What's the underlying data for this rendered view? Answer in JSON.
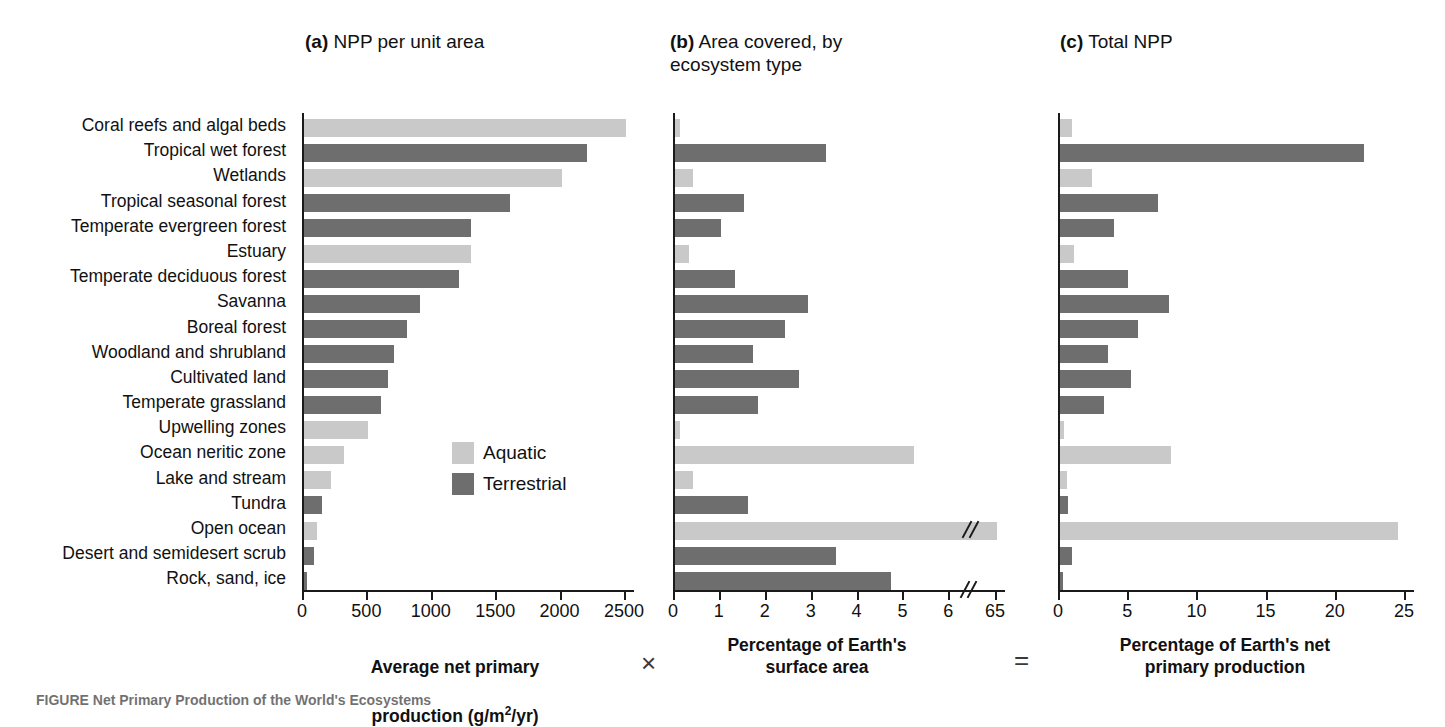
{
  "panels": {
    "a": {
      "prefix": "(a)",
      "title": "NPP per unit area"
    },
    "b": {
      "prefix": "(b)",
      "title": "Area covered, by\necosystem type"
    },
    "c": {
      "prefix": "(c)",
      "title": "Total NPP"
    }
  },
  "legend": {
    "position": "inside-panel-a",
    "items": [
      {
        "label": "Aquatic",
        "color": "#c9c9c9"
      },
      {
        "label": "Terrestrial",
        "color": "#6e6e6e"
      }
    ]
  },
  "captions": {
    "a_line1": "Average net primary",
    "a_line2_pre": "production (g/m",
    "a_line2_sup": "2",
    "a_line2_post": "/yr)",
    "b": "Percentage of Earth's\nsurface area",
    "c": "Percentage of Earth's net\nprimary production",
    "operator_times": "×",
    "operator_equals": "=",
    "figure_caption": "FIGURE  Net Primary Production of the World's Ecosystems"
  },
  "colors": {
    "aquatic": "#c9c9c9",
    "terrestrial": "#6e6e6e",
    "axis": "#1a1a1a",
    "text": "#111111",
    "background": "#ffffff"
  },
  "chart_data": [
    {
      "id": "a",
      "type": "bar",
      "orientation": "horizontal",
      "title": "(a) NPP per unit area",
      "xlabel": "Average net primary production (g/m2/yr)",
      "ylabel": "",
      "xlim": [
        0,
        2500
      ],
      "xticks": [
        0,
        500,
        1000,
        1500,
        2000,
        2500
      ],
      "xticklabels": [
        "0",
        "500",
        "1000",
        "1500",
        "2000",
        "2500"
      ],
      "grid": false,
      "axis_break": false,
      "categories": [
        "Coral reefs and algal beds",
        "Tropical wet forest",
        "Wetlands",
        "Tropical seasonal forest",
        "Temperate evergreen forest",
        "Estuary",
        "Temperate deciduous forest",
        "Savanna",
        "Boreal forest",
        "Woodland and shrubland",
        "Cultivated land",
        "Temperate grassland",
        "Upwelling zones",
        "Ocean neritic zone",
        "Lake and stream",
        "Tundra",
        "Open ocean",
        "Desert and semidesert scrub",
        "Rock, sand, ice"
      ],
      "groups": [
        "Aquatic",
        "Terrestrial",
        "Aquatic",
        "Terrestrial",
        "Terrestrial",
        "Aquatic",
        "Terrestrial",
        "Terrestrial",
        "Terrestrial",
        "Terrestrial",
        "Terrestrial",
        "Terrestrial",
        "Aquatic",
        "Aquatic",
        "Aquatic",
        "Terrestrial",
        "Aquatic",
        "Terrestrial",
        "Terrestrial"
      ],
      "values": [
        2500,
        2200,
        2000,
        1600,
        1300,
        1300,
        1200,
        900,
        800,
        700,
        650,
        600,
        500,
        310,
        210,
        140,
        100,
        80,
        20
      ]
    },
    {
      "id": "b",
      "type": "bar",
      "orientation": "horizontal",
      "title": "(b) Area covered, by ecosystem type",
      "xlabel": "Percentage of Earth's surface area",
      "ylabel": "",
      "xlim": [
        0,
        65
      ],
      "xticks": [
        0,
        1,
        2,
        3,
        4,
        5,
        6,
        65
      ],
      "xticklabels": [
        "0",
        "1",
        "2",
        "3",
        "4",
        "5",
        "6",
        "65"
      ],
      "grid": false,
      "axis_break": true,
      "axis_break_note": "scale break between 6 and 65",
      "categories": [
        "Coral reefs and algal beds",
        "Tropical wet forest",
        "Wetlands",
        "Tropical seasonal forest",
        "Temperate evergreen forest",
        "Estuary",
        "Temperate deciduous forest",
        "Savanna",
        "Boreal forest",
        "Woodland and shrubland",
        "Cultivated land",
        "Temperate grassland",
        "Upwelling zones",
        "Ocean neritic zone",
        "Lake and stream",
        "Tundra",
        "Open ocean",
        "Desert and semidesert scrub",
        "Rock, sand, ice"
      ],
      "groups": [
        "Aquatic",
        "Terrestrial",
        "Aquatic",
        "Terrestrial",
        "Terrestrial",
        "Aquatic",
        "Terrestrial",
        "Terrestrial",
        "Terrestrial",
        "Terrestrial",
        "Terrestrial",
        "Terrestrial",
        "Aquatic",
        "Aquatic",
        "Aquatic",
        "Terrestrial",
        "Aquatic",
        "Terrestrial",
        "Terrestrial"
      ],
      "values": [
        0.1,
        3.3,
        0.4,
        1.5,
        1.0,
        0.3,
        1.3,
        2.9,
        2.4,
        1.7,
        2.7,
        1.8,
        0.1,
        5.2,
        0.4,
        1.6,
        65,
        3.5,
        4.7
      ]
    },
    {
      "id": "c",
      "type": "bar",
      "orientation": "horizontal",
      "title": "(c) Total NPP",
      "xlabel": "Percentage of Earth's net primary production",
      "ylabel": "",
      "xlim": [
        0,
        25
      ],
      "xticks": [
        0,
        5,
        10,
        15,
        20,
        25
      ],
      "xticklabels": [
        "0",
        "5",
        "10",
        "15",
        "20",
        "25"
      ],
      "grid": false,
      "axis_break": false,
      "categories": [
        "Coral reefs and algal beds",
        "Tropical wet forest",
        "Wetlands",
        "Tropical seasonal forest",
        "Temperate evergreen forest",
        "Estuary",
        "Temperate deciduous forest",
        "Savanna",
        "Boreal forest",
        "Woodland and shrubland",
        "Cultivated land",
        "Temperate grassland",
        "Upwelling zones",
        "Ocean neritic zone",
        "Lake and stream",
        "Tundra",
        "Open ocean",
        "Desert and semidesert scrub",
        "Rock, sand, ice"
      ],
      "groups": [
        "Aquatic",
        "Terrestrial",
        "Aquatic",
        "Terrestrial",
        "Terrestrial",
        "Aquatic",
        "Terrestrial",
        "Terrestrial",
        "Terrestrial",
        "Terrestrial",
        "Terrestrial",
        "Terrestrial",
        "Aquatic",
        "Aquatic",
        "Aquatic",
        "Terrestrial",
        "Aquatic",
        "Terrestrial",
        "Terrestrial"
      ],
      "values": [
        0.9,
        22.0,
        2.3,
        7.1,
        3.9,
        1.0,
        4.9,
        7.9,
        5.6,
        3.5,
        5.1,
        3.2,
        0.3,
        8.0,
        0.5,
        0.6,
        24.4,
        0.9,
        0.2
      ]
    }
  ]
}
